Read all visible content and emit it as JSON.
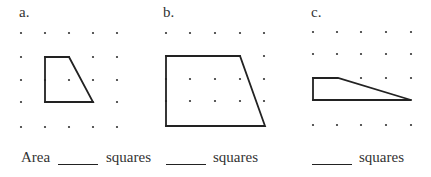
{
  "problems": [
    {
      "label": "a.",
      "dots": {
        "xs": [
          21,
          45,
          69,
          93,
          117
        ],
        "ys": [
          33,
          57,
          80,
          102,
          127
        ]
      },
      "shape": [
        [
          45,
          57
        ],
        [
          69,
          57
        ],
        [
          93,
          102
        ],
        [
          45,
          102
        ]
      ]
    },
    {
      "label": "b.",
      "dots": {
        "xs": [
          166,
          190,
          215,
          240,
          264
        ],
        "ys": [
          33,
          56,
          79,
          101,
          126
        ]
      },
      "shape": [
        [
          166,
          56
        ],
        [
          240,
          56
        ],
        [
          265,
          126
        ],
        [
          166,
          126
        ]
      ]
    },
    {
      "label": "c.",
      "dots": {
        "xs": [
          313,
          337,
          361,
          386,
          411
        ],
        "ys": [
          32,
          54,
          78,
          100,
          125
        ]
      },
      "shape": [
        [
          313,
          78
        ],
        [
          338,
          78
        ],
        [
          411,
          100
        ],
        [
          313,
          100
        ]
      ]
    }
  ],
  "answers": {
    "area_label": "Area",
    "unit": "squares",
    "unit_b": "squares",
    "unit_c": "squares"
  },
  "colors": {
    "ink": "#222222",
    "dot": "#333333"
  }
}
